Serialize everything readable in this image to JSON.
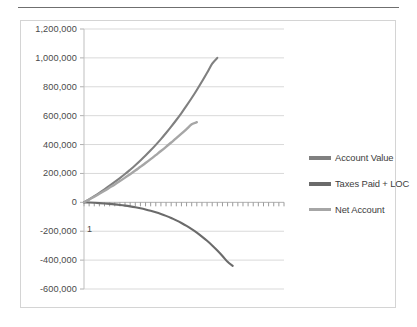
{
  "chart_data": {
    "type": "line",
    "title": "",
    "xlabel": "",
    "ylabel": "",
    "ylim": [
      -600000,
      1200000
    ],
    "grid": true,
    "legend_position": "right",
    "y_ticks": [
      "1,200,000",
      "1,000,000",
      "800,000",
      "600,000",
      "400,000",
      "200,000",
      "0",
      "-200,000",
      "-400,000",
      "-600,000"
    ],
    "y_tick_values": [
      1200000,
      1000000,
      800000,
      600000,
      400000,
      200000,
      0,
      -200000,
      -400000,
      -600000
    ],
    "x_tick_labels": [
      "1"
    ],
    "x_category_count": 40,
    "series": [
      {
        "name": "Account Value",
        "color": "#808080",
        "values": [
          0,
          21000,
          43000,
          66000,
          90000,
          115000,
          141000,
          168000,
          196000,
          226000,
          257000,
          290000,
          324000,
          360000,
          398000,
          438000,
          480000,
          524000,
          570000,
          618000,
          669000,
          722000,
          778000,
          836000,
          897000,
          960000,
          1000000
        ]
      },
      {
        "name": "Taxes Paid + LOC",
        "color": "#6b6b6b",
        "values": [
          0,
          -1500,
          -3200,
          -5200,
          -7600,
          -10500,
          -13900,
          -17900,
          -22600,
          -28000,
          -34200,
          -41300,
          -49400,
          -58600,
          -69000,
          -80700,
          -93800,
          -108500,
          -124900,
          -143100,
          -163300,
          -185600,
          -210100,
          -237000,
          -266400,
          -298500,
          -333400,
          -371200,
          -412000,
          -440000
        ]
      },
      {
        "name": "Net Account",
        "color": "#a6a6a6",
        "values": [
          0,
          19000,
          39000,
          59000,
          80000,
          102000,
          124000,
          147000,
          171000,
          195000,
          220000,
          246000,
          272000,
          299000,
          327000,
          355000,
          384000,
          414000,
          444000,
          475000,
          507000,
          540000,
          555000
        ]
      }
    ]
  },
  "legend": {
    "items": [
      {
        "label": "Account Value",
        "color": "#808080"
      },
      {
        "label": "Taxes Paid + LOC",
        "color": "#6b6b6b"
      },
      {
        "label": "Net Account",
        "color": "#a6a6a6"
      }
    ]
  }
}
